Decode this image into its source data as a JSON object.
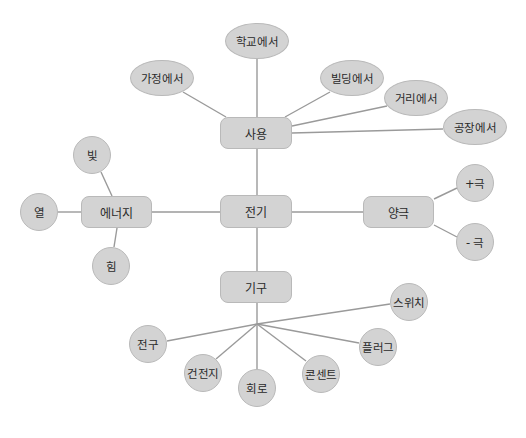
{
  "diagram": {
    "type": "mind-map",
    "colors": {
      "node_fill": "#d3d3d3",
      "node_border": "#b9b9b9",
      "edge": "#9a9a9a",
      "text": "#2a2a2a",
      "background": "#ffffff"
    },
    "center": {
      "id": "electricity",
      "label": "전기"
    },
    "branches": {
      "usage": {
        "label": "사용",
        "children": [
          "가정에서",
          "학교에서",
          "빌딩에서",
          "거리에서",
          "공장에서"
        ]
      },
      "energy": {
        "label": "에너지",
        "children": [
          "빛",
          "열",
          "힘"
        ]
      },
      "poles": {
        "label": "양극",
        "children": [
          "+극",
          "- 극"
        ]
      },
      "devices": {
        "label": "기구",
        "children": [
          "전구",
          "건전지",
          "회로",
          "콘센트",
          "플러그",
          "스위치"
        ]
      }
    }
  }
}
